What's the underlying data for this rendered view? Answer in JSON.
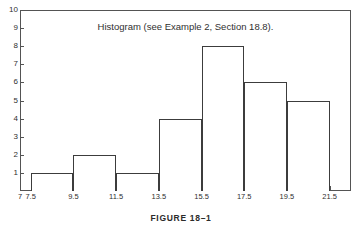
{
  "page": {
    "top_bleed_text": "              ",
    "figure_caption": "FIGURE 18–1"
  },
  "chart_data": {
    "type": "bar",
    "title": "Histogram (see Example 2, Section 18.8).",
    "xlabel": "",
    "ylabel": "",
    "grid": false,
    "legend": null,
    "xlim": [
      7.0,
      22.5
    ],
    "ylim": [
      0,
      10
    ],
    "x_tick_labels": [
      "7",
      "7.5",
      "9.5",
      "11.5",
      "13.5",
      "15.5",
      "17.5",
      "19.5",
      "21.5"
    ],
    "x_tick_values": [
      7,
      7.5,
      9.5,
      11.5,
      13.5,
      15.5,
      17.5,
      19.5,
      21.5
    ],
    "y_tick_labels": [
      "1",
      "2",
      "3",
      "4",
      "5",
      "6",
      "7",
      "8",
      "9",
      "10"
    ],
    "y_tick_values": [
      1,
      2,
      3,
      4,
      5,
      6,
      7,
      8,
      9,
      10
    ],
    "bin_edges": [
      7.5,
      9.5,
      11.5,
      13.5,
      15.5,
      17.5,
      19.5,
      21.5
    ],
    "categories": [
      "7.5-9.5",
      "9.5-11.5",
      "11.5-13.5",
      "13.5-15.5",
      "15.5-17.5",
      "17.5-19.5",
      "19.5-21.5"
    ],
    "values": [
      1,
      2,
      1,
      4,
      8,
      6,
      5
    ],
    "bars": [
      {
        "left": 7.5,
        "right": 9.5,
        "value": 1
      },
      {
        "left": 9.5,
        "right": 11.5,
        "value": 2
      },
      {
        "left": 11.5,
        "right": 13.5,
        "value": 1
      },
      {
        "left": 13.5,
        "right": 15.5,
        "value": 4
      },
      {
        "left": 15.5,
        "right": 17.5,
        "value": 8
      },
      {
        "left": 17.5,
        "right": 19.5,
        "value": 6
      },
      {
        "left": 19.5,
        "right": 21.5,
        "value": 5
      }
    ],
    "colors": {
      "bar_stroke": "#3c3c3c",
      "bar_fill": "#ffffff",
      "axis": "#545454",
      "text": "#2f2f2f",
      "background": "#ffffff"
    }
  }
}
